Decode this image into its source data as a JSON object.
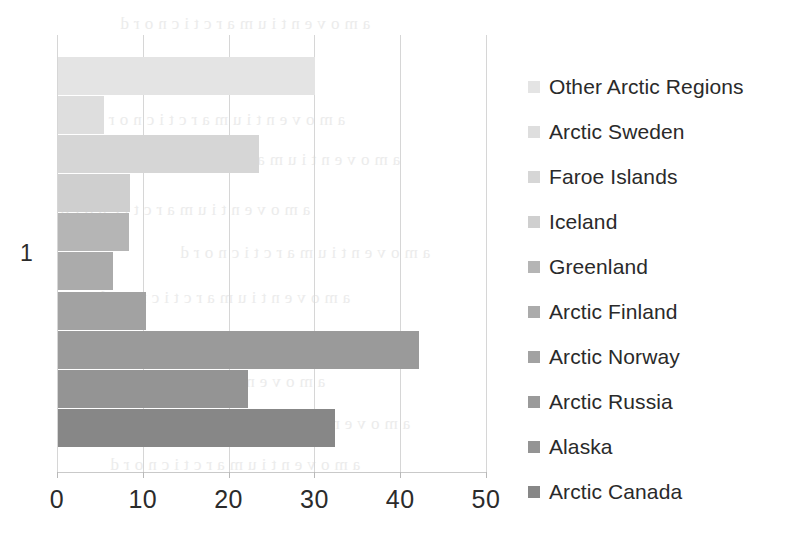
{
  "chart_data": {
    "type": "bar",
    "orientation": "horizontal",
    "title": "",
    "xlabel": "",
    "ylabel": "",
    "xlim": [
      0,
      50
    ],
    "ylim": null,
    "xticks": [
      0,
      10,
      20,
      30,
      40,
      50
    ],
    "category_axis_labels": [
      "1"
    ],
    "grid": true,
    "legend_position": "right",
    "categories": [
      "Other Arctic Regions",
      "Arctic Sweden",
      "Faroe Islands",
      "Iceland",
      "Greenland",
      "Arctic Finland",
      "Arctic Norway",
      "Arctic Russia",
      "Alaska",
      "Arctic Canada"
    ],
    "values": [
      30.0,
      5.4,
      23.4,
      8.4,
      8.3,
      6.4,
      10.3,
      42.1,
      22.2,
      32.3
    ],
    "colors": [
      "#e4e4e4",
      "#dedede",
      "#d6d6d6",
      "#cfcfcf",
      "#b5b5b5",
      "#ababab",
      "#a2a2a2",
      "#9a9a9a",
      "#949494",
      "#878787"
    ],
    "series": [
      {
        "name": "1",
        "points": [
          {
            "label": "Other Arctic Regions",
            "value": 30.0,
            "color": "#e4e4e4"
          },
          {
            "label": "Arctic Sweden",
            "value": 5.4,
            "color": "#dedede"
          },
          {
            "label": "Faroe Islands",
            "value": 23.4,
            "color": "#d6d6d6"
          },
          {
            "label": "Iceland",
            "value": 8.4,
            "color": "#cfcfcf"
          },
          {
            "label": "Greenland",
            "value": 8.3,
            "color": "#b5b5b5"
          },
          {
            "label": "Arctic Finland",
            "value": 6.4,
            "color": "#ababab"
          },
          {
            "label": "Arctic Norway",
            "value": 10.3,
            "color": "#a2a2a2"
          },
          {
            "label": "Arctic Russia",
            "value": 42.1,
            "color": "#9a9a9a"
          },
          {
            "label": "Alaska",
            "value": 22.2,
            "color": "#949494"
          },
          {
            "label": "Arctic Canada",
            "value": 32.3,
            "color": "#878787"
          }
        ]
      }
    ]
  },
  "axis": {
    "x_tick_labels": [
      "0",
      "10",
      "20",
      "30",
      "40",
      "50"
    ],
    "y_category_label": "1"
  },
  "legend": {
    "items": [
      {
        "label": "Other Arctic Regions",
        "color": "#e4e4e4"
      },
      {
        "label": "Arctic Sweden",
        "color": "#dedede"
      },
      {
        "label": "Faroe Islands",
        "color": "#d6d6d6"
      },
      {
        "label": "Iceland",
        "color": "#cfcfcf"
      },
      {
        "label": "Greenland",
        "color": "#b5b5b5"
      },
      {
        "label": "Arctic Finland",
        "color": "#ababab"
      },
      {
        "label": "Arctic Norway",
        "color": "#a2a2a2"
      },
      {
        "label": "Arctic Russia",
        "color": "#9a9a9a"
      },
      {
        "label": "Alaska",
        "color": "#949494"
      },
      {
        "label": "Arctic Canada",
        "color": "#878787"
      }
    ]
  }
}
